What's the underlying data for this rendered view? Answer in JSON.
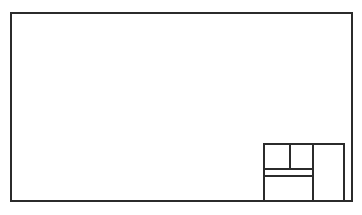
{
  "sheet": {
    "width": 362,
    "height": 215,
    "background_color": "#ffffff",
    "line_color": "#2b2b2b",
    "line_width": 1.6,
    "description": "Engineering drawing sheet border with empty title block in lower right corner"
  },
  "border": {
    "name": "drawing-frame",
    "x": 11,
    "y": 13,
    "width": 341,
    "height": 188,
    "label": ""
  },
  "title_block": {
    "name": "title-block",
    "x": 264,
    "y": 144,
    "width": 80,
    "height": 57,
    "label": "",
    "outer": {
      "left": 264,
      "top": 144,
      "right": 344,
      "bottom": 201
    },
    "dividers": {
      "vertical_main": {
        "name": "title-block-vertical-divider",
        "x": 313,
        "y1": 144,
        "y2": 201,
        "label": ""
      },
      "vertical_upper": {
        "name": "title-block-upper-vertical-divider",
        "x": 290,
        "y1": 144,
        "y2": 169,
        "label": ""
      },
      "horizontal_upper": {
        "name": "title-block-upper-horizontal-divider",
        "x1": 264,
        "x2": 313,
        "y": 169,
        "label": ""
      },
      "horizontal_lower": {
        "name": "title-block-lower-horizontal-divider",
        "x1": 264,
        "x2": 313,
        "y": 176,
        "label": ""
      }
    },
    "cells": [
      {
        "name": "title-block-cell-top-left",
        "x": 264,
        "y": 144,
        "width": 26,
        "height": 25,
        "text": ""
      },
      {
        "name": "title-block-cell-top-middle",
        "x": 290,
        "y": 144,
        "width": 23,
        "height": 25,
        "text": ""
      },
      {
        "name": "title-block-cell-thin-strip",
        "x": 264,
        "y": 169,
        "width": 49,
        "height": 7,
        "text": ""
      },
      {
        "name": "title-block-cell-bottom-left",
        "x": 264,
        "y": 176,
        "width": 49,
        "height": 25,
        "text": ""
      },
      {
        "name": "title-block-cell-right-column",
        "x": 313,
        "y": 144,
        "width": 31,
        "height": 57,
        "text": ""
      }
    ]
  }
}
